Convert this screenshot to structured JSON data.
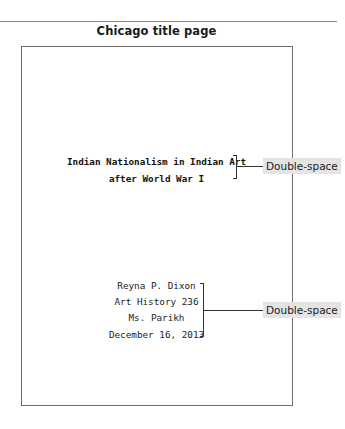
{
  "figure": {
    "heading": "Chicago title page"
  },
  "page": {
    "title_lines": [
      "Indian Nationalism in Indian Art",
      "after World War I"
    ],
    "author_block": [
      "Reyna P. Dixon",
      "Art History 236",
      "Ms. Parikh",
      "December 16, 2013"
    ]
  },
  "annotations": [
    {
      "label": "Double-space",
      "target": "title_lines"
    },
    {
      "label": "Double-space",
      "target": "author_block"
    }
  ],
  "colors": {
    "label_background": "#e4e4e4",
    "border": "#6e6e6e",
    "text": "#1a1a1a"
  }
}
